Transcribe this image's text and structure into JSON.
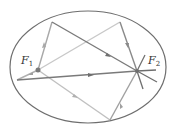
{
  "diagram": {
    "ellipse": {
      "cx": 88,
      "cy": 67,
      "rx": 78,
      "ry": 56,
      "stroke": "#6e6e6e"
    },
    "foci": [
      {
        "id": "F1",
        "label": "F",
        "subscript": "1",
        "x": 38,
        "y": 70,
        "label_x": 21,
        "label_y": 64
      },
      {
        "id": "F2",
        "label": "F",
        "subscript": "2",
        "x": 137,
        "y": 71,
        "label_x": 148,
        "label_y": 64
      }
    ],
    "rays": [
      {
        "from": [
          38,
          70
        ],
        "to": [
          52,
          22
        ],
        "color": "#a8a8a8"
      },
      {
        "from": [
          52,
          22
        ],
        "to": [
          137,
          71
        ],
        "color": "#7a7a7a"
      },
      {
        "from": [
          38,
          70
        ],
        "to": [
          120,
          22
        ],
        "color": "#c8c8c8"
      },
      {
        "from": [
          120,
          22
        ],
        "to": [
          137,
          71
        ],
        "color": "#8a8a8a"
      },
      {
        "from": [
          38,
          70
        ],
        "to": [
          17,
          80
        ],
        "color": "#b0b0b0"
      },
      {
        "from": [
          17,
          80
        ],
        "to": [
          137,
          71
        ],
        "color": "#7a7a7a"
      },
      {
        "from": [
          38,
          70
        ],
        "to": [
          110,
          120
        ],
        "color": "#c0c0c0"
      },
      {
        "from": [
          110,
          120
        ],
        "to": [
          137,
          71
        ],
        "color": "#a0a0a0"
      }
    ],
    "extra_lines_at_F2": [
      {
        "from": [
          137,
          71
        ],
        "to": [
          145,
          55
        ],
        "color": "#6e6e6e"
      },
      {
        "from": [
          137,
          71
        ],
        "to": [
          156,
          70
        ],
        "color": "#6e6e6e"
      },
      {
        "from": [
          137,
          71
        ],
        "to": [
          157,
          82
        ],
        "color": "#6e6e6e"
      },
      {
        "from": [
          137,
          71
        ],
        "to": [
          143,
          89
        ],
        "color": "#6e6e6e"
      }
    ]
  }
}
